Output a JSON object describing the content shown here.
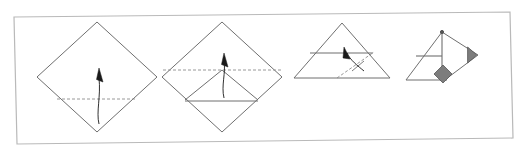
{
  "figure": {
    "kind": "origami-folding-instructions",
    "title_text": "",
    "caption_text": "",
    "panel_count": 4,
    "background_color": "#ffffff",
    "frame": {
      "name": "figure-border-frame",
      "stroke_color": "#b9b9b9",
      "stroke_width": 1.2,
      "fill": "none",
      "skewed": true,
      "corners": "14,17 510,12 513,138 17,144"
    },
    "line_styles": {
      "edge_color": "#6f6f6f",
      "edge_width": 1.0,
      "crease_color": "#8c8c8c",
      "crease_width": 0.9,
      "crease_dash": "3,2",
      "arrow_color": "#1a1a1a",
      "arrow_width": 0.9,
      "accent_fill": "#7d7d7d",
      "accent_stroke": "#555555"
    },
    "panels": [
      {
        "index": 1,
        "name": "panel-step-1",
        "label": "Step 1",
        "shape": "square rotated 45 degrees (diamond)",
        "outline_points": "97,22 157,77 97,132 37,77",
        "creases": [
          {
            "name": "horizontal-valley-crease",
            "type": "dashed",
            "from": "57,99",
            "to": "137,99"
          }
        ],
        "arrows": [
          {
            "name": "fold-up-arrow",
            "direction": "up",
            "tail": "98,122",
            "head": "99,72"
          }
        ],
        "accents": []
      },
      {
        "index": 2,
        "name": "panel-step-2",
        "label": "Step 2",
        "shape": "diamond with bottom point folded up forming inner triangle flap",
        "outline_points": "222,22 282,77 222,132 162,77",
        "creases": [
          {
            "name": "horizontal-center-crease",
            "type": "dashed",
            "from": "163,70",
            "to": "281,70"
          }
        ],
        "folded_edges": [
          {
            "name": "flap-left-edge",
            "from": "185,99",
            "to": "222,70"
          },
          {
            "name": "flap-right-edge",
            "from": "222,70",
            "to": "258,99"
          },
          {
            "name": "flap-bottom-edge",
            "from": "185,101",
            "to": "258,101"
          }
        ],
        "arrows": [
          {
            "name": "fold-up-arrow",
            "direction": "up",
            "tail": "224,96",
            "head": "225,57"
          }
        ],
        "accents": []
      },
      {
        "index": 3,
        "name": "panel-step-3",
        "label": "Step 3",
        "shape": "flattened triangle with horizontal band and diagonal crease",
        "outline_points": "342,23 390,78 294,78",
        "creases": [
          {
            "name": "diagonal-valley-crease",
            "type": "dashed",
            "from": "337,78",
            "to": "373,52"
          },
          {
            "name": "crease-tick-mark",
            "type": "solid",
            "from": "354,70",
            "to": "364,62"
          }
        ],
        "folded_edges": [
          {
            "name": "horizontal-band-line",
            "from": "310,53",
            "to": "373,53"
          },
          {
            "name": "base-line",
            "from": "294,78",
            "to": "390,78"
          }
        ],
        "arrows": [
          {
            "name": "fold-over-arrow",
            "direction": "up-left",
            "tail": "365,72",
            "head": "345,50"
          }
        ],
        "accents": []
      },
      {
        "index": 4,
        "name": "panel-step-4",
        "label": "Step 4",
        "shape": "completed unit shown at an angle with shaded tabs",
        "outline_points": "442,32 478,56 442,80 406,80",
        "folded_edges": [
          {
            "name": "vertical-center-line",
            "from": "442,32",
            "to": "442,78"
          },
          {
            "name": "horizontal-line",
            "from": "417,56",
            "to": "442,56"
          },
          {
            "name": "base-line",
            "from": "406,80",
            "to": "446,80"
          },
          {
            "name": "upper-right-edge",
            "from": "442,32",
            "to": "478,56"
          },
          {
            "name": "lower-right-edge",
            "from": "478,56",
            "to": "446,80"
          }
        ],
        "accents": [
          {
            "name": "shaded-diamond-tab",
            "shape": "diamond",
            "center": "443,74",
            "size": 9,
            "fill": "#7d7d7d"
          },
          {
            "name": "shaded-triangle-tab",
            "shape": "triangle-right",
            "center": "472,55",
            "size": 8,
            "fill": "#7d7d7d"
          },
          {
            "name": "apex-dot",
            "shape": "dot",
            "center": "442,32",
            "size": 2,
            "fill": "#555555"
          }
        ],
        "arrows": []
      }
    ]
  }
}
